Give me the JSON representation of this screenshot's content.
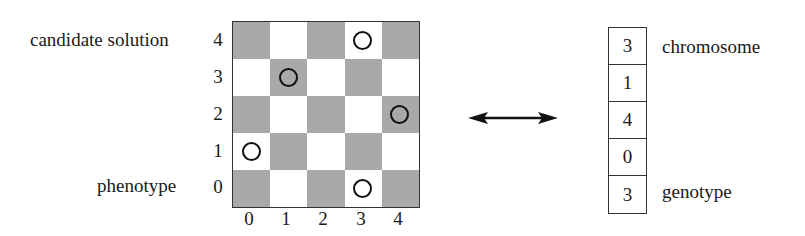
{
  "labels": {
    "candidate_solution": "candidate solution",
    "phenotype": "phenotype",
    "chromosome": "chromosome",
    "genotype": "genotype"
  },
  "board": {
    "size": 5,
    "x_ticks": [
      "0",
      "1",
      "2",
      "3",
      "4"
    ],
    "y_ticks": [
      "4",
      "3",
      "2",
      "1",
      "0"
    ],
    "colors": {
      "dark": "#a9a9a9",
      "light": "#ffffff",
      "border": "#333333"
    },
    "queens": [
      {
        "col": 3,
        "row": 4
      },
      {
        "col": 1,
        "row": 3
      },
      {
        "col": 4,
        "row": 2
      },
      {
        "col": 0,
        "row": 1
      },
      {
        "col": 3,
        "row": 0
      }
    ]
  },
  "mapping_arrow": "bidirectional",
  "chromosome": {
    "genes": [
      "3",
      "1",
      "4",
      "0",
      "3"
    ]
  }
}
